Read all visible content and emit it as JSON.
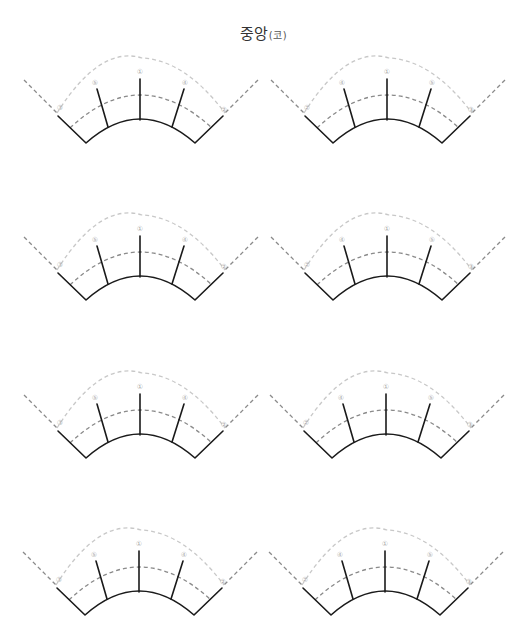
{
  "header": {
    "title": "중앙",
    "subtitle": "(코)"
  },
  "colors": {
    "solid_line": "#1a1a1a",
    "inner_dash": "#8a8a8a",
    "outer_dash": "#c8c8c8",
    "label": "#aaaaaa"
  },
  "diagrams": [
    {
      "id": "fan-r1-left",
      "cx": 140,
      "dy": 0,
      "labels": [
        "③",
        "⑤",
        "①",
        "④",
        "②"
      ]
    },
    {
      "id": "fan-r1-right",
      "cx": 387,
      "dy": 0,
      "labels": [
        "②",
        "④",
        "①",
        "⑤",
        "③"
      ]
    },
    {
      "id": "fan-r2-left",
      "cx": 140,
      "dy": 157,
      "labels": [
        "③",
        "⑤",
        "①",
        "④",
        "②"
      ]
    },
    {
      "id": "fan-r2-right",
      "cx": 387,
      "dy": 157,
      "labels": [
        "②",
        "④",
        "①",
        "⑤",
        "③"
      ]
    },
    {
      "id": "fan-r3-left",
      "cx": 140,
      "dy": 315,
      "labels": [
        "③",
        "⑤",
        "①",
        "④",
        "②"
      ]
    },
    {
      "id": "fan-r3-right",
      "cx": 386,
      "dy": 315,
      "labels": [
        "②",
        "④",
        "①",
        "⑤",
        "③"
      ]
    },
    {
      "id": "fan-r4-left",
      "cx": 139,
      "dy": 472,
      "labels": [
        "③",
        "⑤",
        "①",
        "④",
        "②"
      ]
    },
    {
      "id": "fan-r4-right",
      "cx": 385,
      "dy": 472,
      "labels": [
        "②",
        "④",
        "①",
        "⑤",
        "③"
      ]
    }
  ]
}
